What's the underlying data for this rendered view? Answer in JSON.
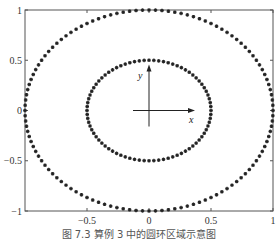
{
  "chart_data": {
    "type": "scatter",
    "title": "",
    "xlabel": "",
    "ylabel": "",
    "xlim": [
      -1,
      1
    ],
    "ylim": [
      -1,
      1
    ],
    "grid": false,
    "legend": null,
    "x_ticks": [
      -0.5,
      0,
      0.5,
      1
    ],
    "x_tick_labels": [
      "−0.5",
      "0",
      "0.5",
      "1"
    ],
    "y_ticks": [
      -1,
      -0.5,
      0,
      0.5,
      1
    ],
    "y_tick_labels": [
      "−1",
      "−0.5",
      "0",
      "0.5",
      "1"
    ],
    "marker": "+*",
    "marker_color": "#222222",
    "series": [
      {
        "name": "outer-circle",
        "shape": "circle",
        "center": [
          0,
          0
        ],
        "radius": 1.0,
        "num_points": 120
      },
      {
        "name": "inner-circle",
        "shape": "circle",
        "center": [
          0,
          0
        ],
        "radius": 0.5,
        "num_points": 80
      }
    ],
    "annotations": [
      {
        "type": "axis-arrows",
        "origin": [
          0,
          0
        ],
        "x_label": "x",
        "y_label": "y"
      }
    ]
  },
  "caption": "图 7.3   算例 3 中的圆环区域示意图"
}
